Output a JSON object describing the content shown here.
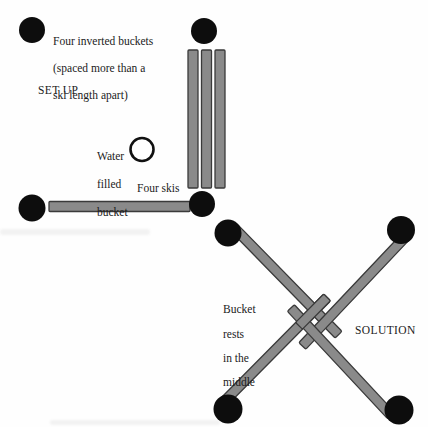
{
  "diagram_title": "Four skis and bucket balance puzzle",
  "colors": {
    "background": "#fefefe",
    "inverted_bucket_fill": "#0d0d0d",
    "ski_fill": "#8a8a8a",
    "ski_border": "#3a3a3a",
    "water_bucket_fill": "#ffffff",
    "water_bucket_stroke": "#111111",
    "text": "#1b1b1b"
  },
  "setup": {
    "section_label": "SET UP",
    "buckets_note_lines": {
      "0": "Four inverted buckets",
      "1": "(spaced more than a",
      "2": "ski length apart)"
    },
    "water_bucket_label_lines": {
      "0": "Water",
      "1": "filled",
      "2": "bucket"
    },
    "skis_label": "Four skis",
    "inverted_bucket_count": 4,
    "ski_count": 4
  },
  "solution": {
    "section_label": "SOLUTION",
    "note_lines": {
      "0": "Bucket",
      "1": "rests",
      "2": "in the",
      "3": "middle"
    }
  }
}
